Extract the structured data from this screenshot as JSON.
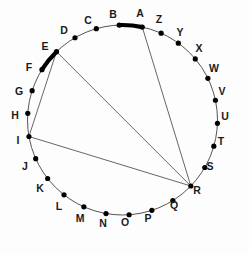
{
  "figure": {
    "background_color": "#fdfdfd",
    "circle": {
      "center_x": 122.5,
      "center_y": 120.0,
      "radius": 95.0,
      "stroke_color": "#555555",
      "stroke_width": 1.0
    },
    "vertex_style": {
      "dot_color": "#000000",
      "dot_radius": 2.6,
      "label_color": "#1a1a1a",
      "label_font_size": 10.5
    },
    "vertices": [
      {
        "id": "A",
        "label": "A",
        "angle_deg": 78,
        "x": 142.24,
        "y": 27.09,
        "label_x": 140.0,
        "label_y": 14.0
      },
      {
        "id": "B",
        "label": "B",
        "angle_deg": 92,
        "x": 119.18,
        "y": 25.07,
        "label_x": 113.0,
        "label_y": 15.0
      },
      {
        "id": "C",
        "label": "C",
        "angle_deg": 106,
        "x": 96.31,
        "y": 28.69,
        "label_x": 88.0,
        "label_y": 21.0
      },
      {
        "id": "D",
        "label": "D",
        "angle_deg": 120,
        "x": 75.0,
        "y": 37.73,
        "label_x": 64.0,
        "label_y": 31.0
      },
      {
        "id": "E",
        "label": "E",
        "angle_deg": 134,
        "x": 56.5,
        "y": 51.66,
        "label_x": 45.0,
        "label_y": 47.0
      },
      {
        "id": "F",
        "label": "F",
        "angle_deg": 148,
        "x": 42.0,
        "y": 69.65,
        "label_x": 29.0,
        "label_y": 68.0
      },
      {
        "id": "G",
        "label": "G",
        "angle_deg": 162,
        "x": 32.14,
        "y": 90.64,
        "label_x": 19.0,
        "label_y": 92.0
      },
      {
        "id": "H",
        "label": "H",
        "angle_deg": 176,
        "x": 27.68,
        "y": 113.37,
        "label_x": 15.0,
        "label_y": 116.0
      },
      {
        "id": "I",
        "label": "I",
        "angle_deg": 190,
        "x": 29.13,
        "y": 136.5,
        "label_x": 18.0,
        "label_y": 141.0
      },
      {
        "id": "J",
        "label": "J",
        "angle_deg": 204,
        "x": 35.72,
        "y": 158.63,
        "label_x": 25.0,
        "label_y": 167.0
      },
      {
        "id": "K",
        "label": "K",
        "angle_deg": 218,
        "x": 47.65,
        "y": 178.47,
        "label_x": 40.0,
        "label_y": 189.0
      },
      {
        "id": "L",
        "label": "L",
        "angle_deg": 232,
        "x": 63.99,
        "y": 194.86,
        "label_x": 59.0,
        "label_y": 207.0
      },
      {
        "id": "M",
        "label": "M",
        "angle_deg": 246,
        "x": 83.88,
        "y": 206.79,
        "label_x": 80.0,
        "label_y": 219.0
      },
      {
        "id": "N",
        "label": "N",
        "angle_deg": 260,
        "x": 105.99,
        "y": 213.57,
        "label_x": 103.0,
        "label_y": 224.0
      },
      {
        "id": "O",
        "label": "O",
        "angle_deg": 274,
        "x": 129.13,
        "y": 214.79,
        "label_x": 125.0,
        "label_y": 223.0
      },
      {
        "id": "P",
        "label": "P",
        "angle_deg": 288,
        "x": 151.87,
        "y": 210.36,
        "label_x": 148.0,
        "label_y": 219.0
      },
      {
        "id": "Q",
        "label": "Q",
        "angle_deg": 302,
        "x": 172.82,
        "y": 200.6,
        "label_x": 174.0,
        "label_y": 206.0
      },
      {
        "id": "R",
        "label": "R",
        "angle_deg": 316,
        "x": 190.84,
        "y": 186.04,
        "label_x": 197.0,
        "label_y": 191.0
      },
      {
        "id": "S",
        "label": "S",
        "angle_deg": 330,
        "x": 204.77,
        "y": 167.5,
        "label_x": 210.0,
        "label_y": 167.0
      },
      {
        "id": "T",
        "label": "T",
        "angle_deg": 344,
        "x": 213.81,
        "y": 146.19,
        "label_x": 221.0,
        "label_y": 142.0
      },
      {
        "id": "U",
        "label": "U",
        "angle_deg": 358,
        "x": 217.43,
        "y": 123.32,
        "label_x": 225.0,
        "label_y": 117.0
      },
      {
        "id": "V",
        "label": "V",
        "angle_deg": 12,
        "x": 215.43,
        "y": 100.25,
        "label_x": 222.0,
        "label_y": 92.0
      },
      {
        "id": "W",
        "label": "W",
        "angle_deg": 26,
        "x": 207.89,
        "y": 78.36,
        "label_x": 214.0,
        "label_y": 69.0
      },
      {
        "id": "X",
        "label": "X",
        "angle_deg": 40,
        "x": 195.27,
        "y": 58.93,
        "label_x": 199.0,
        "label_y": 49.0
      },
      {
        "id": "Y",
        "label": "Y",
        "angle_deg": 54,
        "x": 178.34,
        "y": 43.13,
        "label_x": 180.0,
        "label_y": 33.0
      },
      {
        "id": "Z",
        "label": "Z",
        "angle_deg": 66,
        "x": 161.14,
        "y": 33.22,
        "label_x": 159.0,
        "label_y": 20.0
      }
    ],
    "chords": [
      {
        "from": "A",
        "to": "R",
        "stroke_color": "#555555",
        "stroke_width": 0.9
      },
      {
        "from": "E",
        "to": "R",
        "stroke_color": "#555555",
        "stroke_width": 0.9
      },
      {
        "from": "I",
        "to": "R",
        "stroke_color": "#555555",
        "stroke_width": 0.9
      },
      {
        "from": "E",
        "to": "I",
        "stroke_color": "#555555",
        "stroke_width": 0.9
      }
    ],
    "highlighted_arcs": [
      {
        "from": "B",
        "to": "A",
        "stroke_color": "#000000",
        "stroke_width": 4.2
      },
      {
        "from": "E",
        "to": "F",
        "stroke_color": "#000000",
        "stroke_width": 4.2
      }
    ]
  }
}
